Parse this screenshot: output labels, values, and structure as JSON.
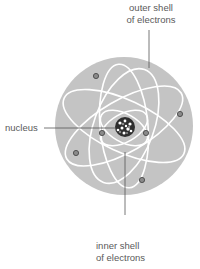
{
  "labels": {
    "outer_shell_line1": "outer shell",
    "outer_shell_line2": "of electrons",
    "nucleus": "nucleus",
    "inner_shell_line1": "inner shell",
    "inner_shell_line2": "of electrons"
  },
  "colors": {
    "atom_fill": "#c4c4c4",
    "orbit_stroke": "#ffffff",
    "electron_fill": "#8a8a8a",
    "electron_stroke": "#4a4a4a",
    "nucleus_fill": "#2e2e2e",
    "leader_line": "#555555"
  },
  "atom": {
    "cx": 124,
    "cy": 126,
    "r": 69
  },
  "electrons": [
    {
      "shell": "outer",
      "x": 96,
      "y": 76
    },
    {
      "shell": "outer",
      "x": 180,
      "y": 114
    },
    {
      "shell": "outer",
      "x": 76,
      "y": 153
    },
    {
      "shell": "outer",
      "x": 142,
      "y": 180
    },
    {
      "shell": "inner",
      "x": 102,
      "y": 133
    },
    {
      "shell": "inner",
      "x": 146,
      "y": 133
    }
  ]
}
